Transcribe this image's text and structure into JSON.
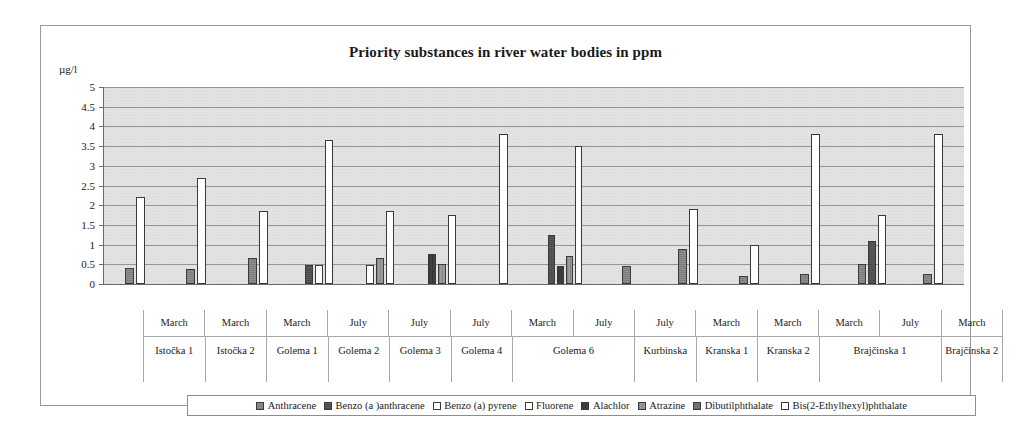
{
  "chart_data": {
    "type": "bar",
    "title": "Priority substances in river water bodies in ppm",
    "xlabel": "",
    "ylabel": "µg/l",
    "ylim": [
      0,
      5
    ],
    "ytick_values": [
      5,
      4.5,
      4,
      3.5,
      3,
      2.5,
      2,
      1.5,
      1,
      0.5,
      0
    ],
    "ytick_labels": [
      "5",
      "4.5",
      "4",
      "3.5",
      "3",
      "2.5",
      "2",
      "1.5",
      "1",
      "0.5",
      "0"
    ],
    "grid": true,
    "legend_position": "bottom",
    "categories": [
      {
        "month": "March",
        "site": "Istočka 1"
      },
      {
        "month": "March",
        "site": "Istočka 2"
      },
      {
        "month": "March",
        "site": "Golema 1"
      },
      {
        "month": "July",
        "site": "Golema 2"
      },
      {
        "month": "July",
        "site": "Golema 3"
      },
      {
        "month": "July",
        "site": "Golema 4"
      },
      {
        "month": "March",
        "site": "Golema 6"
      },
      {
        "month": "July",
        "site": "Golema 6"
      },
      {
        "month": "July",
        "site": "Kurbinska"
      },
      {
        "month": "March",
        "site": "Kranska 1"
      },
      {
        "month": "March",
        "site": "Kranska 2"
      },
      {
        "month": "March",
        "site": "Brajčinska 1"
      },
      {
        "month": "July",
        "site": "Brajčinska 1"
      },
      {
        "month": "March",
        "site": "Brajčinska 2"
      }
    ],
    "site_spans": [
      {
        "label": "Istočka 1",
        "span": 1
      },
      {
        "label": "Istočka 2",
        "span": 1
      },
      {
        "label": "Golema 1",
        "span": 1
      },
      {
        "label": "Golema 2",
        "span": 1
      },
      {
        "label": "Golema 3",
        "span": 1
      },
      {
        "label": "Golema 4",
        "span": 1
      },
      {
        "label": "Golema 6",
        "span": 2
      },
      {
        "label": "Kurbinska",
        "span": 1
      },
      {
        "label": "Kranska 1",
        "span": 1
      },
      {
        "label": "Kranska 2",
        "span": 1
      },
      {
        "label": "Brajčinska 1",
        "span": 2
      },
      {
        "label": "Brajčinska 2",
        "span": 1
      }
    ],
    "series": [
      {
        "name": "Anthracene",
        "values": [
          0.4,
          0.38,
          0.65,
          0,
          0,
          0,
          0,
          0,
          0.45,
          0.9,
          0.2,
          0.25,
          0.5,
          0.25
        ]
      },
      {
        "name": "Benzo (a )anthracene",
        "values": [
          0,
          0,
          0,
          0.48,
          0,
          0,
          0,
          1.25,
          0,
          0,
          0,
          0,
          1.1,
          0
        ]
      },
      {
        "name": "Benzo (a) pyrene",
        "values": [
          0,
          0,
          0,
          0.48,
          0.48,
          0,
          0,
          0,
          0,
          0,
          0,
          0,
          0,
          0
        ]
      },
      {
        "name": "Fluorene",
        "values": [
          0,
          0,
          0,
          0,
          0,
          0,
          0,
          0,
          0,
          0,
          0,
          0,
          0,
          0
        ]
      },
      {
        "name": "Alachlor",
        "values": [
          0,
          0,
          0,
          0,
          0,
          0.75,
          0,
          0.45,
          0,
          0,
          0,
          0,
          0,
          0
        ]
      },
      {
        "name": "Atrazine",
        "values": [
          0,
          0,
          0,
          0,
          0.65,
          0.5,
          0,
          0.7,
          0,
          0,
          0,
          0,
          0,
          0
        ]
      },
      {
        "name": "Dibutilphthalate",
        "values": [
          0,
          0,
          0,
          0,
          0,
          0,
          0,
          0,
          0,
          0,
          0,
          0,
          0,
          0
        ]
      },
      {
        "name": "Bis(2-Ethylhexyl)phthalate",
        "values": [
          2.2,
          2.7,
          1.85,
          3.65,
          1.85,
          1.75,
          3.8,
          3.5,
          0,
          1.9,
          1.0,
          3.8,
          1.75,
          3.8
        ]
      }
    ]
  },
  "legend": {
    "items": [
      {
        "label": "Anthracene"
      },
      {
        "label": "Benzo (a )anthracene"
      },
      {
        "label": "Benzo (a) pyrene"
      },
      {
        "label": "Fluorene"
      },
      {
        "label": "Alachlor"
      },
      {
        "label": "Atrazine"
      },
      {
        "label": "Dibutilphthalate"
      },
      {
        "label": "Bis(2-Ethylhexyl)phthalate"
      }
    ]
  }
}
